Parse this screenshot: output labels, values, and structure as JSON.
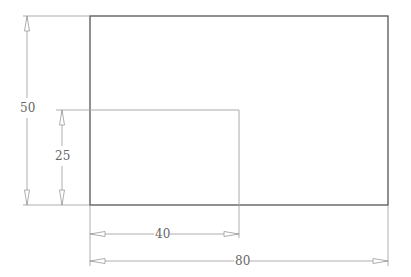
{
  "drawing": {
    "outer_rectangle": {
      "width": 80,
      "height": 50
    },
    "inner_rectangle": {
      "width": 40,
      "height": 25
    },
    "dimensions": {
      "outer_height": "50",
      "inner_height": "25",
      "inner_width": "40",
      "outer_width": "80"
    },
    "colors": {
      "outline": "#555555",
      "dimension_line": "#999999",
      "text": "#666666"
    }
  }
}
